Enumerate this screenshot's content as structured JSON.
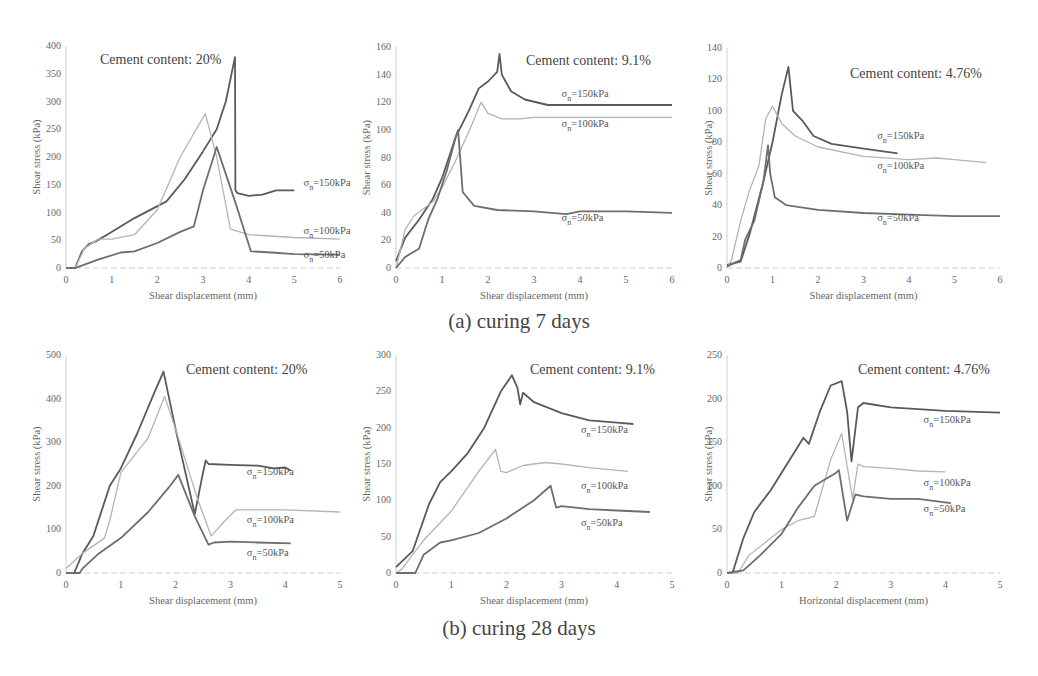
{
  "captions": {
    "row_a": "(a) curing 7 days",
    "row_b": "(b) curing 28 days"
  },
  "colors": {
    "s150": "#5a5a5a",
    "s100": "#b4b4b4",
    "s50": "#6e6e6e",
    "axis": "#cfcfcf",
    "text": "#666666"
  },
  "chart_data": [
    {
      "id": "a1",
      "type": "line",
      "title": "Cement content: 20%",
      "xlabel": "Shear displacement (mm)",
      "ylabel": "Shear stress (kPa)",
      "xlim": [
        0,
        6
      ],
      "ylim": [
        0,
        400
      ],
      "xticks": [
        0,
        1,
        2,
        3,
        4,
        5,
        6
      ],
      "yticks": [
        0,
        50,
        100,
        150,
        200,
        250,
        300,
        350,
        400
      ],
      "grid": false,
      "series": [
        {
          "name": "σn=150kPa",
          "key": "s150",
          "label_at": [
            5.2,
            148
          ],
          "x": [
            0,
            0.2,
            0.35,
            0.5,
            0.65,
            0.9,
            1.5,
            2.2,
            2.6,
            3.0,
            3.3,
            3.5,
            3.7,
            3.71,
            3.75,
            4.0,
            4.3,
            4.6,
            5.0
          ],
          "y": [
            0,
            0,
            30,
            43,
            48,
            60,
            90,
            120,
            160,
            210,
            250,
            300,
            380,
            140,
            135,
            130,
            132,
            140,
            140
          ]
        },
        {
          "name": "σn=100kPa",
          "key": "s100",
          "label_at": [
            5.2,
            62
          ],
          "x": [
            0,
            0.2,
            0.4,
            0.7,
            1.0,
            1.5,
            2.0,
            2.5,
            3.05,
            3.3,
            3.6,
            4.0,
            5.0,
            6.0
          ],
          "y": [
            0,
            0,
            35,
            52,
            52,
            60,
            105,
            200,
            278,
            200,
            70,
            60,
            55,
            52
          ]
        },
        {
          "name": "σn=50kPa",
          "key": "s50",
          "label_at": [
            5.2,
            18
          ],
          "x": [
            0,
            0.2,
            0.3,
            0.7,
            1.2,
            1.5,
            2.0,
            2.5,
            2.8,
            3.0,
            3.3,
            3.7,
            4.05,
            4.5,
            5.0,
            6.0
          ],
          "y": [
            0,
            0,
            3,
            15,
            28,
            30,
            45,
            65,
            75,
            140,
            218,
            120,
            30,
            28,
            25,
            24
          ]
        }
      ]
    },
    {
      "id": "a2",
      "type": "line",
      "title": "Cement content: 9.1%",
      "xlabel": "Shear displacement (mm)",
      "ylabel": "Shear stress (kPa)",
      "xlim": [
        0,
        6
      ],
      "ylim": [
        0,
        160
      ],
      "xticks": [
        0,
        1,
        2,
        3,
        4,
        5,
        6
      ],
      "yticks": [
        0,
        20,
        40,
        60,
        80,
        100,
        120,
        140,
        160
      ],
      "grid": false,
      "series": [
        {
          "name": "σn=150kPa",
          "key": "s150",
          "label_at": [
            3.6,
            124
          ],
          "x": [
            0,
            0.2,
            0.5,
            0.8,
            1.0,
            1.3,
            1.6,
            1.8,
            2.0,
            2.2,
            2.25,
            2.3,
            2.5,
            2.8,
            3.3,
            4.0,
            5.0,
            6.0
          ],
          "y": [
            5,
            22,
            35,
            50,
            65,
            95,
            115,
            130,
            135,
            142,
            155,
            140,
            128,
            122,
            118,
            118,
            118,
            118
          ]
        },
        {
          "name": "σn=100kPa",
          "key": "s100",
          "label_at": [
            3.6,
            102
          ],
          "x": [
            0,
            0.2,
            0.4,
            0.8,
            1.0,
            1.3,
            1.6,
            1.85,
            2.0,
            2.3,
            2.7,
            3.0,
            4.0,
            5.0,
            6.0
          ],
          "y": [
            0,
            28,
            38,
            48,
            58,
            78,
            100,
            120,
            112,
            108,
            108,
            109,
            109,
            109,
            109
          ]
        },
        {
          "name": "σn=50kPa",
          "key": "s50",
          "label_at": [
            3.6,
            34
          ],
          "x": [
            0,
            0.2,
            0.5,
            0.7,
            0.9,
            1.1,
            1.3,
            1.35,
            1.45,
            1.7,
            2.2,
            3.0,
            3.7,
            4.0,
            5.0,
            6.0
          ],
          "y": [
            0,
            8,
            14,
            35,
            50,
            70,
            95,
            100,
            55,
            45,
            42,
            41,
            39,
            41,
            41,
            40
          ]
        }
      ]
    },
    {
      "id": "a3",
      "type": "line",
      "title": "Cement content: 4.76%",
      "xlabel": "Shear displacement (mm)",
      "ylabel": "Shear stress (kPa)",
      "xlim": [
        0,
        6
      ],
      "ylim": [
        0,
        140
      ],
      "xticks": [
        0,
        1,
        2,
        3,
        4,
        5,
        6
      ],
      "yticks": [
        0,
        20,
        40,
        60,
        80,
        100,
        120,
        140
      ],
      "grid": false,
      "series": [
        {
          "name": "σn=150kPa",
          "key": "s150",
          "label_at": [
            3.3,
            82
          ],
          "x": [
            0,
            0.3,
            0.5,
            0.8,
            1.0,
            1.2,
            1.35,
            1.45,
            1.65,
            1.9,
            2.3,
            3.0,
            3.75
          ],
          "y": [
            2,
            4,
            22,
            55,
            80,
            110,
            128,
            100,
            94,
            84,
            79,
            76,
            73
          ]
        },
        {
          "name": "σn=100kPa",
          "key": "s100",
          "label_at": [
            3.3,
            63
          ],
          "x": [
            0,
            0.1,
            0.3,
            0.5,
            0.7,
            0.85,
            1.0,
            1.2,
            1.5,
            2.0,
            3.0,
            4.0,
            4.6,
            5.0,
            5.7
          ],
          "y": [
            0,
            5,
            30,
            50,
            65,
            95,
            103,
            92,
            84,
            77,
            71,
            69,
            70,
            69,
            67
          ]
        },
        {
          "name": "σn=50kPa",
          "key": "s50",
          "label_at": [
            3.3,
            30
          ],
          "x": [
            0,
            0.3,
            0.4,
            0.6,
            0.8,
            0.9,
            0.95,
            1.05,
            1.3,
            2.0,
            3.0,
            4.0,
            5.0,
            6.0
          ],
          "y": [
            1,
            5,
            18,
            30,
            55,
            78,
            60,
            45,
            40,
            37,
            35,
            34,
            33,
            33
          ]
        }
      ]
    },
    {
      "id": "b1",
      "type": "line",
      "title": "Cement content: 20%",
      "xlabel": "Shear displacement (mm)",
      "ylabel": "Shear stress (kPa)",
      "xlim": [
        0,
        5
      ],
      "ylim": [
        0,
        500
      ],
      "xticks": [
        0,
        1,
        2,
        3,
        4,
        5
      ],
      "yticks": [
        0,
        100,
        200,
        300,
        400,
        500
      ],
      "grid": false,
      "series": [
        {
          "name": "σn=150kPa",
          "key": "s150",
          "label_at": [
            3.3,
            225
          ],
          "x": [
            0,
            0.15,
            0.3,
            0.5,
            0.8,
            1.0,
            1.3,
            1.6,
            1.78,
            2.0,
            2.35,
            2.5,
            2.55,
            2.6,
            3.0,
            3.5,
            3.8,
            4.0,
            4.1
          ],
          "y": [
            0,
            0,
            45,
            85,
            200,
            240,
            320,
            410,
            462,
            330,
            135,
            230,
            258,
            250,
            248,
            246,
            240,
            242,
            235
          ]
        },
        {
          "name": "σn=100kPa",
          "key": "s100",
          "label_at": [
            3.3,
            115
          ],
          "x": [
            0,
            0.3,
            0.7,
            0.8,
            1.0,
            1.5,
            1.8,
            2.0,
            2.4,
            2.65,
            2.9,
            3.1,
            3.5,
            4.0,
            5.0
          ],
          "y": [
            10,
            45,
            80,
            120,
            230,
            310,
            405,
            330,
            170,
            85,
            120,
            145,
            145,
            145,
            140
          ]
        },
        {
          "name": "σn=50kPa",
          "key": "s50",
          "label_at": [
            3.3,
            40
          ],
          "x": [
            0,
            0.25,
            0.3,
            0.6,
            1.0,
            1.5,
            1.9,
            2.05,
            2.35,
            2.6,
            2.7,
            3.0,
            3.5,
            4.1
          ],
          "y": [
            0,
            0,
            10,
            45,
            80,
            140,
            200,
            225,
            130,
            65,
            70,
            72,
            70,
            68
          ]
        }
      ]
    },
    {
      "id": "b2",
      "type": "line",
      "title": "Cement content: 9.1%",
      "xlabel": "Shear displacement (mm)",
      "ylabel": "Shear stress (kPa)",
      "xlim": [
        0,
        5
      ],
      "ylim": [
        0,
        300
      ],
      "xticks": [
        0,
        1,
        2,
        3,
        4,
        5
      ],
      "yticks": [
        0,
        50,
        100,
        150,
        200,
        250,
        300
      ],
      "grid": false,
      "series": [
        {
          "name": "σn=150kPa",
          "key": "s150",
          "label_at": [
            3.35,
            192
          ],
          "x": [
            0,
            0.3,
            0.6,
            0.8,
            1.0,
            1.3,
            1.6,
            1.9,
            2.1,
            2.2,
            2.25,
            2.3,
            2.5,
            3.0,
            3.5,
            4.0,
            4.3
          ],
          "y": [
            8,
            30,
            95,
            125,
            140,
            165,
            200,
            250,
            272,
            255,
            232,
            248,
            235,
            220,
            210,
            207,
            205
          ]
        },
        {
          "name": "σn=100kPa",
          "key": "s100",
          "label_at": [
            3.35,
            115
          ],
          "x": [
            0,
            0.1,
            0.5,
            1.0,
            1.5,
            1.8,
            1.9,
            2.0,
            2.3,
            2.7,
            3.0,
            3.5,
            4.2
          ],
          "y": [
            0,
            5,
            45,
            85,
            140,
            170,
            140,
            138,
            148,
            152,
            150,
            145,
            140
          ]
        },
        {
          "name": "σn=50kPa",
          "key": "s50",
          "label_at": [
            3.35,
            65
          ],
          "x": [
            0,
            0.35,
            0.5,
            0.8,
            1.0,
            1.5,
            2.0,
            2.5,
            2.8,
            2.9,
            3.0,
            3.5,
            4.0,
            4.6
          ],
          "y": [
            0,
            0,
            25,
            42,
            45,
            55,
            75,
            100,
            120,
            90,
            92,
            88,
            86,
            84
          ]
        }
      ]
    },
    {
      "id": "b3",
      "type": "line",
      "title": "Cement content: 4.76%",
      "xlabel": "Horizontal displacement (mm)",
      "ylabel": "Shear stress (kPa)",
      "xlim": [
        0,
        5
      ],
      "ylim": [
        0,
        250
      ],
      "xticks": [
        0,
        1,
        2,
        3,
        4,
        5
      ],
      "yticks": [
        0,
        50,
        100,
        150,
        200,
        250
      ],
      "grid": false,
      "series": [
        {
          "name": "σn=150kPa",
          "key": "s150",
          "label_at": [
            3.6,
            172
          ],
          "x": [
            0,
            0.1,
            0.3,
            0.5,
            0.8,
            1.0,
            1.3,
            1.4,
            1.5,
            1.7,
            1.9,
            2.1,
            2.2,
            2.28,
            2.4,
            2.5,
            3.0,
            4.0,
            5.0
          ],
          "y": [
            0,
            0,
            40,
            70,
            95,
            115,
            145,
            155,
            148,
            185,
            215,
            220,
            185,
            128,
            190,
            195,
            190,
            186,
            184
          ]
        },
        {
          "name": "σn=100kPa",
          "key": "s100",
          "label_at": [
            3.6,
            100
          ],
          "x": [
            0,
            0.2,
            0.4,
            0.7,
            1.0,
            1.3,
            1.6,
            1.9,
            2.1,
            2.3,
            2.4,
            2.5,
            3.0,
            3.5,
            4.0
          ],
          "y": [
            0,
            0,
            20,
            35,
            50,
            60,
            65,
            130,
            160,
            85,
            125,
            122,
            120,
            117,
            116
          ]
        },
        {
          "name": "σn=50kPa",
          "key": "s50",
          "label_at": [
            3.6,
            70
          ],
          "x": [
            0,
            0.3,
            0.6,
            1.0,
            1.3,
            1.6,
            2.0,
            2.05,
            2.2,
            2.35,
            2.5,
            3.0,
            3.5,
            4.1
          ],
          "y": [
            0,
            3,
            20,
            45,
            75,
            100,
            115,
            118,
            60,
            90,
            88,
            85,
            85,
            80
          ]
        }
      ]
    }
  ]
}
